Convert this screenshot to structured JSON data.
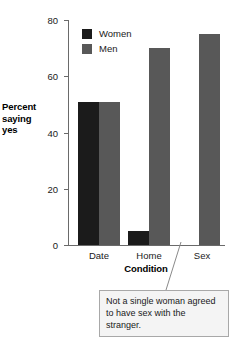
{
  "chart_data": {
    "type": "bar",
    "title": "",
    "xlabel": "Condition",
    "ylabel": "Percent saying yes",
    "categories": [
      "Date",
      "Home",
      "Sex"
    ],
    "series": [
      {
        "name": "Women",
        "color": "#1b1b1b",
        "values": [
          51,
          5,
          0
        ]
      },
      {
        "name": "Men",
        "color": "#585858",
        "values": [
          51,
          70,
          75
        ]
      }
    ],
    "ylim": [
      0,
      80
    ],
    "yticks": [
      0,
      20,
      40,
      60,
      80
    ],
    "ytick_labels": [
      "0",
      "20",
      "40",
      "60",
      "80"
    ],
    "grid": false,
    "legend_position": "top-left-inside",
    "annotations": [
      {
        "text": "Not a single woman agreed to have sex with the stranger.",
        "points_to": "Sex / Women bar (value 0)"
      }
    ]
  },
  "axis": {
    "ylabel_lines": [
      "Percent",
      "saying",
      "yes"
    ],
    "xlabel": "Condition"
  },
  "legend": {
    "items": [
      {
        "label": "Women"
      },
      {
        "label": "Men"
      }
    ]
  },
  "callout": {
    "line1": "Not a single woman agreed",
    "line2": "to have sex with the stranger."
  }
}
